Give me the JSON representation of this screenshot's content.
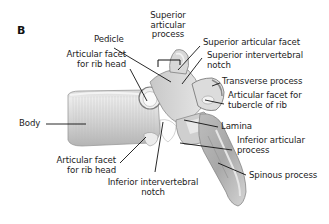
{
  "figure": {
    "panel_label": "B",
    "labels": {
      "superior_articular_process": [
        "Superior",
        "articular",
        "process"
      ],
      "pedicle": "Pedicle",
      "articular_facet_rib_head_upper": [
        "Articular facet",
        "for rib head"
      ],
      "superior_articular_facet": "Superior articular facet",
      "superior_intervertebral_notch": [
        "Superior intervertebral",
        "notch"
      ],
      "transverse_process": "Transverse process",
      "articular_facet_tubercle": [
        "Articular facet for",
        "tubercle of rib"
      ],
      "body": "Body",
      "lamina": "Lamina",
      "inferior_articular_process": [
        "Inferior articular",
        "process"
      ],
      "articular_facet_rib_head_lower": [
        "Articular facet",
        "for rib head"
      ],
      "spinous_process": "Spinous process",
      "inferior_intervertebral_notch": [
        "Inferior intervertebral",
        "notch"
      ]
    },
    "colors": {
      "bone_light": "#e4e4e4",
      "bone_mid": "#c4c4c4",
      "bone_dark": "#8f8f8f",
      "leader_line": "#111111",
      "text": "#1c1c1c"
    }
  }
}
